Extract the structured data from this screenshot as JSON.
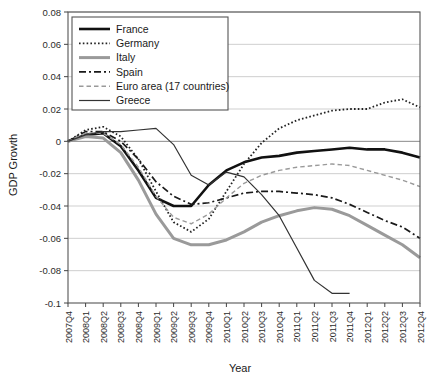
{
  "chart_data": {
    "type": "line",
    "title": "",
    "xlabel": "Year",
    "ylabel": "GDP Growth",
    "ylim": [
      -0.1,
      0.08
    ],
    "ytick_step": 0.02,
    "grid": true,
    "legend_position": "top-left-inside",
    "ytick_labels": [
      "0.08",
      "0.06",
      "0.04",
      "0.02",
      "0",
      "-0.02",
      "-0.04",
      "-0.06",
      "-0.08",
      "-0.1"
    ],
    "ytick_values": [
      0.08,
      0.06,
      0.04,
      0.02,
      0,
      -0.02,
      -0.04,
      -0.06,
      -0.08,
      -0.1
    ],
    "categories": [
      "2007Q4",
      "2008Q1",
      "2008Q2",
      "2008Q3",
      "2008Q4",
      "2009Q1",
      "2009Q2",
      "2009Q3",
      "2009Q4",
      "2010Q1",
      "2010Q2",
      "2010Q3",
      "2010Q4",
      "2011Q1",
      "2011Q2",
      "2011Q3",
      "2011Q4",
      "2012Q1",
      "2012Q2",
      "2012Q3",
      "2012Q4"
    ],
    "series": [
      {
        "name": "France",
        "color": "#111111",
        "width": 2.6,
        "dash": "none",
        "values": [
          0,
          0.004,
          0.005,
          -0.003,
          -0.018,
          -0.035,
          -0.04,
          -0.04,
          -0.027,
          -0.018,
          -0.013,
          -0.01,
          -0.009,
          -0.007,
          -0.006,
          -0.005,
          -0.004,
          -0.005,
          -0.005,
          -0.007,
          -0.01
        ]
      },
      {
        "name": "Germany",
        "color": "#222222",
        "width": 1.8,
        "dash": "1.6 2.2",
        "values": [
          0,
          0.007,
          0.009,
          0.003,
          -0.011,
          -0.031,
          -0.05,
          -0.056,
          -0.048,
          -0.031,
          -0.014,
          -0.001,
          0.008,
          0.013,
          0.016,
          0.019,
          0.02,
          0.02,
          0.024,
          0.026,
          0.021
        ]
      },
      {
        "name": "Italy",
        "color": "#9a9a9a",
        "width": 3.0,
        "dash": "none",
        "values": [
          0,
          0.003,
          0.002,
          -0.007,
          -0.024,
          -0.045,
          -0.06,
          -0.064,
          -0.064,
          -0.061,
          -0.056,
          -0.05,
          -0.046,
          -0.043,
          -0.041,
          -0.042,
          -0.046,
          -0.052,
          -0.058,
          -0.064,
          -0.072
        ]
      },
      {
        "name": "Spain",
        "color": "#1a1a1a",
        "width": 1.7,
        "dash": "7 3 2 3",
        "values": [
          0,
          0.006,
          0.006,
          0.0,
          -0.011,
          -0.025,
          -0.034,
          -0.039,
          -0.038,
          -0.035,
          -0.032,
          -0.031,
          -0.031,
          -0.032,
          -0.033,
          -0.035,
          -0.039,
          -0.044,
          -0.049,
          -0.053,
          -0.06
        ]
      },
      {
        "name": "Euro area (17 countries)",
        "color": "#9a9a9a",
        "width": 1.4,
        "dash": "4.5 3",
        "values": [
          0,
          0.005,
          0.005,
          -0.002,
          -0.016,
          -0.034,
          -0.047,
          -0.051,
          -0.045,
          -0.035,
          -0.026,
          -0.021,
          -0.018,
          -0.016,
          -0.015,
          -0.014,
          -0.015,
          -0.018,
          -0.021,
          -0.024,
          -0.028
        ]
      },
      {
        "name": "Greece",
        "color": "#333333",
        "width": 1.2,
        "dash": "none",
        "values": [
          0,
          0.004,
          0.006,
          0.006,
          0.007,
          0.008,
          -0.002,
          -0.021,
          -0.027,
          -0.019,
          -0.022,
          -0.033,
          -0.046,
          -0.066,
          -0.086,
          -0.094,
          -0.094,
          null,
          null,
          null,
          null
        ]
      }
    ]
  },
  "legend": {
    "items": [
      {
        "label": "France"
      },
      {
        "label": "Germany"
      },
      {
        "label": "Italy"
      },
      {
        "label": "Spain"
      },
      {
        "label": "Euro area (17 countries)"
      },
      {
        "label": "Greece"
      }
    ]
  }
}
